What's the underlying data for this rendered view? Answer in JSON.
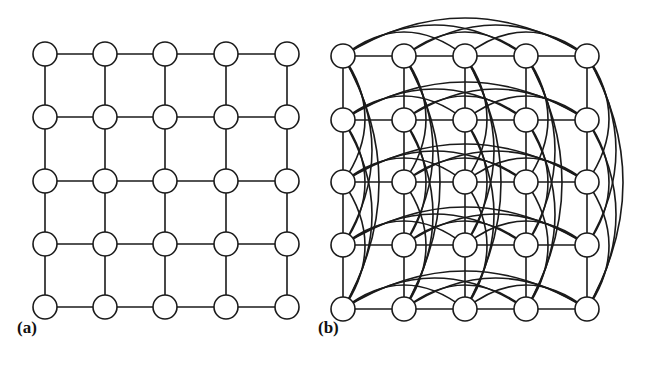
{
  "panels": [
    {
      "id": "a",
      "label": "(a)",
      "description": "5x5 grid graph with nearest-neighbor edges",
      "rows": 5,
      "cols": 5,
      "xs": [
        45,
        105,
        165,
        226,
        287
      ],
      "ys": [
        54,
        117,
        181,
        244,
        307
      ],
      "long_range": false
    },
    {
      "id": "b",
      "label": "(b)",
      "description": "5x5 grid graph with nearest-neighbor edges plus long-range curved edges within each row and column",
      "rows": 5,
      "cols": 5,
      "xs": [
        343,
        404,
        465,
        526,
        587
      ],
      "ys": [
        56,
        120,
        182,
        245,
        309
      ],
      "long_range": true
    }
  ],
  "style": {
    "node_radius": 12,
    "node_fill": "#ffffff",
    "stroke": "#1a1a1a"
  }
}
